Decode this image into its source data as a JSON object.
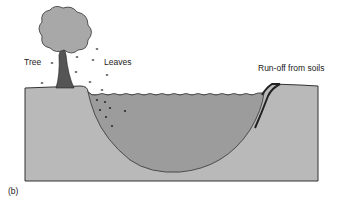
{
  "figure": {
    "panel_label": "(b)",
    "labels": {
      "tree": "Tree",
      "leaves": "Leaves",
      "runoff": "Run-off from soils"
    },
    "colors": {
      "soil": "#b7b7b7",
      "water": "#9a9a9a",
      "tree_canopy": "#a8a8a8",
      "trunk": "#555555",
      "outline": "#333333"
    }
  }
}
